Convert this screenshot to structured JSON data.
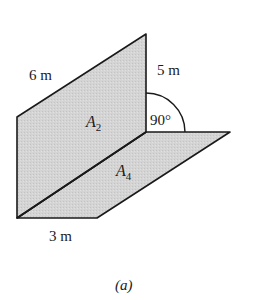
{
  "figure": {
    "caption": "(a)",
    "colors": {
      "panel_fill": "#d6d6d6",
      "stroke": "#1a1a1a",
      "background": "#ffffff"
    },
    "labels": {
      "slant_edge": "6 m",
      "vertical_edge": "5 m",
      "bottom_edge": "3 m",
      "angle": "90°",
      "area_vertical_base": "A",
      "area_vertical_sub": "2",
      "area_floor_base": "A",
      "area_floor_sub": "4"
    },
    "geometry": {
      "vertical_panel": [
        [
          17,
          117
        ],
        [
          146,
          34
        ],
        [
          146,
          132
        ],
        [
          17,
          218
        ]
      ],
      "floor_panel": [
        [
          17,
          218
        ],
        [
          146,
          132
        ],
        [
          230,
          132
        ],
        [
          97,
          218
        ]
      ],
      "arc": {
        "cx": 147,
        "cy": 132,
        "r": 39
      }
    }
  }
}
